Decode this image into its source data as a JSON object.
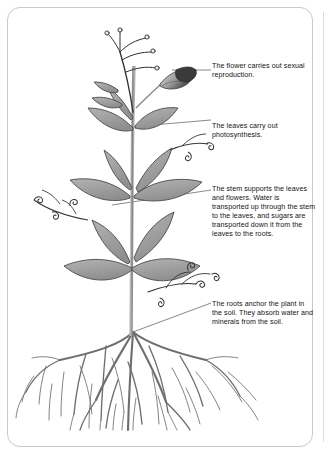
{
  "figure": {
    "style": "greyscale line-and-wash botanical illustration",
    "background_color": "#ffffff",
    "border_color": "#c9c9c9"
  },
  "labels": [
    {
      "id": "flower",
      "name": "flower-label",
      "text": "The flower carries out sexual reproduction.",
      "leader": "horizontal line from flower bud to text"
    },
    {
      "id": "leaves",
      "name": "leaves-label",
      "text": "The leaves carry out photosynthesis.",
      "leader": "line sloping up from upper leaf to text"
    },
    {
      "id": "stem",
      "name": "stem-label",
      "text": "The stem supports the leaves and flowers. Water is transported up through the stem to the leaves, and sugars are transported down it from the leaves to the roots.",
      "leader": "line sloping up from main stem to text"
    },
    {
      "id": "roots",
      "name": "roots-label",
      "text": "The roots anchor the plant in the soil. They absorb water and minerals from the soil.",
      "leader": "diagonal line from root crown to text"
    }
  ],
  "plant_parts": {
    "flower_label_name": "flower bud",
    "leaf_label_name": "leaf",
    "stem_label_name": "stem",
    "root_label_name": "root system",
    "tendril_label_name": "tendril"
  },
  "colors": {
    "leaf_fill": "#9a9a9a",
    "leaf_outline": "#4f4f4f",
    "stem": "#8c8c8c",
    "root": "#6e6e6e",
    "flower_dark": "#3a3a3a",
    "flower_light": "#d2d2d2",
    "leader_line": "#6b6b6b",
    "text": "#141414"
  }
}
